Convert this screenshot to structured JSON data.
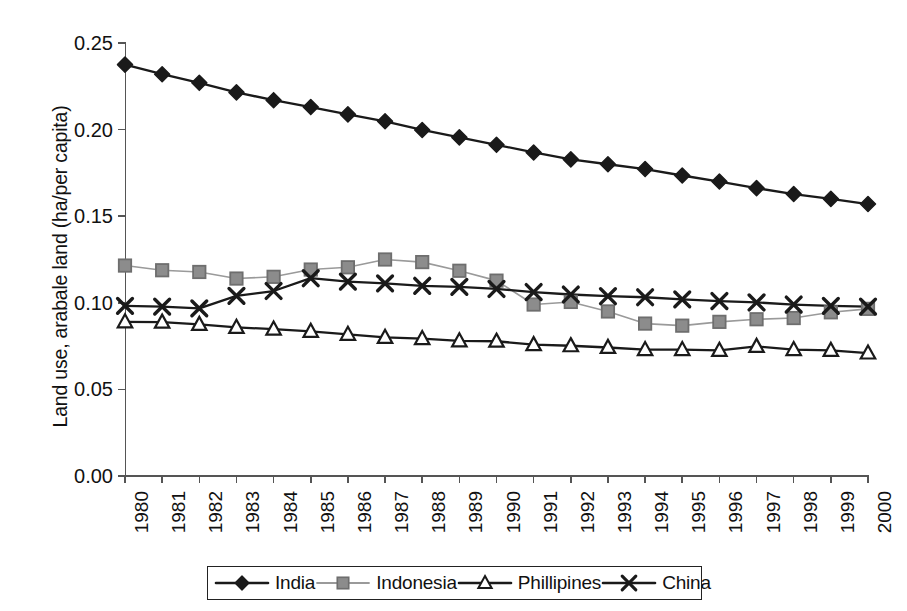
{
  "chart_data": {
    "type": "line",
    "title": "",
    "xlabel": "",
    "ylabel": "Land use, arabale land (ha/per capita)",
    "ylim": [
      0.0,
      0.25
    ],
    "ytick_labels": [
      "0.00",
      "0.05",
      "0.10",
      "0.15",
      "0.20",
      "0.25"
    ],
    "ytick_values": [
      0.0,
      0.05,
      0.1,
      0.15,
      0.2,
      0.25
    ],
    "grid": false,
    "legend_position": "bottom",
    "categories": [
      "1980",
      "1981",
      "1982",
      "1983",
      "1984",
      "1985",
      "1986",
      "1987",
      "1988",
      "1989",
      "1990",
      "1991",
      "1992",
      "1993",
      "1994",
      "1995",
      "1996",
      "1997",
      "1998",
      "1999",
      "2000"
    ],
    "series": [
      {
        "name": "India",
        "marker": "filled-diamond",
        "color": "#1a1a1a",
        "line_color": "#1a1a1a",
        "values": [
          0.2375,
          0.232,
          0.227,
          0.2215,
          0.217,
          0.213,
          0.2088,
          0.2048,
          0.1998,
          0.1955,
          0.1912,
          0.1868,
          0.1828,
          0.18,
          0.1772,
          0.1735,
          0.17,
          0.1662,
          0.1628,
          0.16,
          0.157
        ]
      },
      {
        "name": "Indonesia",
        "marker": "filled-square",
        "color": "#8c8c8c",
        "line_color": "#9a9a9a",
        "values": [
          0.1215,
          0.1188,
          0.1178,
          0.114,
          0.115,
          0.1192,
          0.1205,
          0.125,
          0.1235,
          0.1185,
          0.1128,
          0.099,
          0.1005,
          0.095,
          0.088,
          0.0868,
          0.089,
          0.0905,
          0.0912,
          0.0945,
          0.0965
        ]
      },
      {
        "name": "Phillipines",
        "marker": "open-triangle",
        "color": "#1a1a1a",
        "line_color": "#1a1a1a",
        "values": [
          0.089,
          0.0888,
          0.0875,
          0.0858,
          0.0848,
          0.0835,
          0.0818,
          0.08,
          0.0793,
          0.078,
          0.0778,
          0.0758,
          0.0752,
          0.0742,
          0.073,
          0.073,
          0.0725,
          0.0748,
          0.073,
          0.0725,
          0.071
        ]
      },
      {
        "name": "China",
        "marker": "cross-x",
        "color": "#1a1a1a",
        "line_color": "#1a1a1a",
        "values": [
          0.0982,
          0.0978,
          0.0968,
          0.104,
          0.1068,
          0.1142,
          0.1122,
          0.1112,
          0.1098,
          0.1092,
          0.108,
          0.1062,
          0.1048,
          0.1038,
          0.1032,
          0.102,
          0.101,
          0.1002,
          0.099,
          0.0982,
          0.0978
        ]
      }
    ]
  }
}
